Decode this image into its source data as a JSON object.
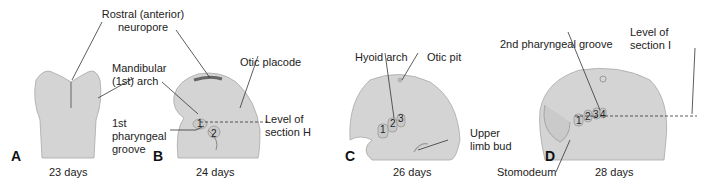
{
  "figure": {
    "panels": [
      {
        "letter": "A",
        "days": "23 days"
      },
      {
        "letter": "B",
        "days": "24 days"
      },
      {
        "letter": "C",
        "days": "26 days"
      },
      {
        "letter": "D",
        "days": "28 days"
      }
    ],
    "labels": {
      "rostral_1": "Rostral (anterior)",
      "rostral_2": "neuropore",
      "mandibular_1": "Mandibular",
      "mandibular_2": "(1st) arch",
      "groove_1": "1st",
      "groove_2": "pharyngeal",
      "groove_3": "groove",
      "otic_placode": "Otic placode",
      "section_h_1": "Level of",
      "section_h_2": "section H",
      "hyoid_arch": "Hyoid arch",
      "otic_pit": "Otic pit",
      "upper_limb_1": "Upper",
      "upper_limb_2": "limb bud",
      "second_groove": "2nd pharyngeal groove",
      "section_i_1": "Level of",
      "section_i_2": "section I",
      "stomodeum": "Stomodeum"
    },
    "arch_numbers": {
      "b": [
        "1",
        "2"
      ],
      "c": [
        "1",
        "2",
        "3"
      ],
      "d": [
        "1",
        "2",
        "3",
        "4"
      ]
    },
    "colors": {
      "embryo_fill": "#d4d4d4",
      "embryo_shade": "#bdbdbd",
      "outline": "#9a9a9a",
      "line": "#333333"
    }
  }
}
